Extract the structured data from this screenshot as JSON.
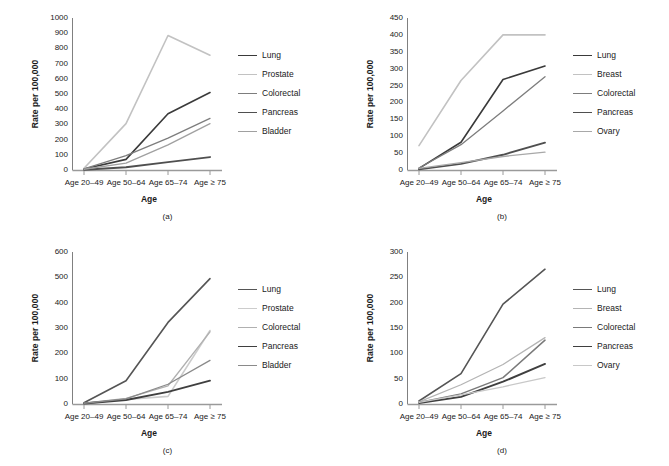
{
  "figure": {
    "panels": [
      {
        "caption": "(a)",
        "ylabel": "Rate per 100,000",
        "xlabel": "Age",
        "categories": [
          "Age 20–49",
          "Age 50–64",
          "Age 65–74",
          "Age ≥ 75"
        ],
        "yticks": [
          0,
          100,
          200,
          300,
          400,
          500,
          600,
          700,
          800,
          900,
          1000
        ],
        "ylim": [
          0,
          1000
        ],
        "series": [
          {
            "name": "Lung",
            "color": "#3a3a3a",
            "width": 1.6,
            "values": [
              6,
              70,
              370,
              510
            ]
          },
          {
            "name": "Prostate",
            "color": "#c2c2c2",
            "width": 1.6,
            "values": [
              12,
              305,
              885,
              755
            ]
          },
          {
            "name": "Colorectal",
            "color": "#7d7d7d",
            "width": 1.3,
            "values": [
              8,
              95,
              210,
              340
            ]
          },
          {
            "name": "Pancreas",
            "color": "#4f4f4f",
            "width": 1.9,
            "values": [
              2,
              18,
              52,
              85
            ]
          },
          {
            "name": "Bladder",
            "color": "#a0a0a0",
            "width": 1.3,
            "values": [
              5,
              45,
              165,
              305
            ]
          }
        ]
      },
      {
        "caption": "(b)",
        "ylabel": "Rate per 100,000",
        "xlabel": "Age",
        "categories": [
          "Age 20–49",
          "Age 50–64",
          "Age 65–74",
          "Age ≥ 75"
        ],
        "yticks": [
          0,
          50,
          100,
          150,
          200,
          250,
          300,
          350,
          400,
          450
        ],
        "ylim": [
          0,
          450
        ],
        "series": [
          {
            "name": "Lung",
            "color": "#3a3a3a",
            "width": 1.6,
            "values": [
              5,
              82,
              268,
              308
            ]
          },
          {
            "name": "Breast",
            "color": "#c2c2c2",
            "width": 1.6,
            "values": [
              72,
              265,
              400,
              400
            ]
          },
          {
            "name": "Colorectal",
            "color": "#7d7d7d",
            "width": 1.3,
            "values": [
              6,
              75,
              175,
              276
            ]
          },
          {
            "name": "Pancreas",
            "color": "#4f4f4f",
            "width": 1.9,
            "values": [
              2,
              18,
              45,
              81
            ]
          },
          {
            "name": "Ovary",
            "color": "#a8a8a8",
            "width": 1.3,
            "values": [
              5,
              22,
              40,
              53
            ]
          }
        ]
      },
      {
        "caption": "(c)",
        "ylabel": "Rate per 100,000",
        "xlabel": "Age",
        "categories": [
          "Age 20–49",
          "Age 50–64",
          "Age 65–74",
          "Age ≥ 75"
        ],
        "yticks": [
          0,
          100,
          200,
          300,
          400,
          500,
          600
        ],
        "ylim": [
          0,
          600
        ],
        "series": [
          {
            "name": "Lung",
            "color": "#555555",
            "width": 1.6,
            "values": [
              5,
              92,
              322,
              495
            ]
          },
          {
            "name": "Prostate",
            "color": "#cccccc",
            "width": 1.6,
            "values": [
              2,
              18,
              30,
              290
            ]
          },
          {
            "name": "Colorectal",
            "color": "#b0b0b0",
            "width": 1.3,
            "values": [
              3,
              22,
              72,
              285
            ]
          },
          {
            "name": "Pancreas",
            "color": "#3f3f3f",
            "width": 1.9,
            "values": [
              2,
              16,
              48,
              92
            ]
          },
          {
            "name": "Bladder",
            "color": "#8a8a8a",
            "width": 1.3,
            "values": [
              3,
              20,
              78,
              172
            ]
          }
        ]
      },
      {
        "caption": "(d)",
        "ylabel": "Rate per 100,000",
        "xlabel": "Age",
        "categories": [
          "Age 20–49",
          "Age 50–64",
          "Age 65–74",
          "Age ≥ 75"
        ],
        "yticks": [
          0,
          50,
          100,
          150,
          200,
          250,
          300
        ],
        "ylim": [
          0,
          300
        ],
        "series": [
          {
            "name": "Lung",
            "color": "#555555",
            "width": 1.6,
            "values": [
              6,
              60,
              197,
              266
            ]
          },
          {
            "name": "Breast",
            "color": "#b4b4b4",
            "width": 1.3,
            "values": [
              4,
              38,
              78,
              131
            ]
          },
          {
            "name": "Colorectal",
            "color": "#7a7a7a",
            "width": 1.5,
            "values": [
              3,
              20,
              52,
              126
            ]
          },
          {
            "name": "Pancreas",
            "color": "#3f3f3f",
            "width": 1.9,
            "values": [
              2,
              14,
              44,
              79
            ]
          },
          {
            "name": "Ovary",
            "color": "#c8c8c8",
            "width": 1.3,
            "values": [
              3,
              18,
              34,
              52
            ]
          }
        ]
      }
    ]
  },
  "chart_data": [
    {
      "type": "line",
      "title": "(a)",
      "xlabel": "Age",
      "ylabel": "Rate per 100,000",
      "categories": [
        "Age 20–49",
        "Age 50–64",
        "Age 65–74",
        "Age ≥ 75"
      ],
      "ylim": [
        0,
        1000
      ],
      "yticks": [
        0,
        100,
        200,
        300,
        400,
        500,
        600,
        700,
        800,
        900,
        1000
      ],
      "grid": false,
      "legend_position": "right",
      "series": [
        {
          "name": "Lung",
          "values": [
            6,
            70,
            370,
            510
          ]
        },
        {
          "name": "Prostate",
          "values": [
            12,
            305,
            885,
            755
          ]
        },
        {
          "name": "Colorectal",
          "values": [
            8,
            95,
            210,
            340
          ]
        },
        {
          "name": "Pancreas",
          "values": [
            2,
            18,
            52,
            85
          ]
        },
        {
          "name": "Bladder",
          "values": [
            5,
            45,
            165,
            305
          ]
        }
      ]
    },
    {
      "type": "line",
      "title": "(b)",
      "xlabel": "Age",
      "ylabel": "Rate per 100,000",
      "categories": [
        "Age 20–49",
        "Age 50–64",
        "Age 65–74",
        "Age ≥ 75"
      ],
      "ylim": [
        0,
        450
      ],
      "yticks": [
        0,
        50,
        100,
        150,
        200,
        250,
        300,
        350,
        400,
        450
      ],
      "grid": false,
      "legend_position": "right",
      "series": [
        {
          "name": "Lung",
          "values": [
            5,
            82,
            268,
            308
          ]
        },
        {
          "name": "Breast",
          "values": [
            72,
            265,
            400,
            400
          ]
        },
        {
          "name": "Colorectal",
          "values": [
            6,
            75,
            175,
            276
          ]
        },
        {
          "name": "Pancreas",
          "values": [
            2,
            18,
            45,
            81
          ]
        },
        {
          "name": "Ovary",
          "values": [
            5,
            22,
            40,
            53
          ]
        }
      ]
    },
    {
      "type": "line",
      "title": "(c)",
      "xlabel": "Age",
      "ylabel": "Rate per 100,000",
      "categories": [
        "Age 20–49",
        "Age 50–64",
        "Age 65–74",
        "Age ≥ 75"
      ],
      "ylim": [
        0,
        600
      ],
      "yticks": [
        0,
        100,
        200,
        300,
        400,
        500,
        600
      ],
      "grid": false,
      "legend_position": "right",
      "series": [
        {
          "name": "Lung",
          "values": [
            5,
            92,
            322,
            495
          ]
        },
        {
          "name": "Prostate",
          "values": [
            2,
            18,
            30,
            290
          ]
        },
        {
          "name": "Colorectal",
          "values": [
            3,
            22,
            72,
            285
          ]
        },
        {
          "name": "Pancreas",
          "values": [
            2,
            16,
            48,
            92
          ]
        },
        {
          "name": "Bladder",
          "values": [
            3,
            20,
            78,
            172
          ]
        }
      ]
    },
    {
      "type": "line",
      "title": "(d)",
      "xlabel": "Age",
      "ylabel": "Rate per 100,000",
      "categories": [
        "Age 20–49",
        "Age 50–64",
        "Age 65–74",
        "Age ≥ 75"
      ],
      "ylim": [
        0,
        300
      ],
      "yticks": [
        0,
        50,
        100,
        150,
        200,
        250,
        300
      ],
      "grid": false,
      "legend_position": "right",
      "series": [
        {
          "name": "Lung",
          "values": [
            6,
            60,
            197,
            266
          ]
        },
        {
          "name": "Breast",
          "values": [
            4,
            38,
            78,
            131
          ]
        },
        {
          "name": "Colorectal",
          "values": [
            3,
            20,
            52,
            126
          ]
        },
        {
          "name": "Pancreas",
          "values": [
            2,
            14,
            44,
            79
          ]
        },
        {
          "name": "Ovary",
          "values": [
            3,
            18,
            34,
            52
          ]
        }
      ]
    }
  ]
}
